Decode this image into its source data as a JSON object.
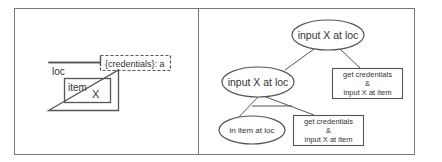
{
  "left_panel": {
    "loc_label": "loc",
    "item_label": "item",
    "x_label": "X",
    "tag_label": "{credentials}: a"
  },
  "right_panel": {
    "root_node": "input X at loc",
    "mid_node": "input X at loc",
    "right_box": {
      "line1": "get credentials",
      "line2": "&",
      "line3": "input X at item"
    },
    "leaf_node": "in item at loc",
    "bottom_box": {
      "line1": "get credentials",
      "line2": "&",
      "line3": "input X at item"
    }
  },
  "colors": {
    "stroke": "#555555",
    "text": "#333333",
    "background": "#ffffff"
  }
}
